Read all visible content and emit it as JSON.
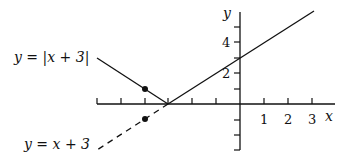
{
  "diagram": {
    "colors": {
      "ink": "#111111",
      "background": "#ffffff"
    },
    "axes": {
      "x_label": "x",
      "y_label": "y",
      "x_tick_labels": [
        "1",
        "2",
        "3"
      ],
      "y_tick_labels": [
        "2",
        "4"
      ],
      "x_ticks": [
        -6,
        -5,
        -4,
        -3,
        -2,
        -1,
        1,
        2,
        3
      ],
      "y_ticks": [
        -3,
        -2,
        -1,
        1,
        2,
        3,
        4,
        5
      ]
    },
    "curves": [
      {
        "name": "abs",
        "label": "y = |x + 3|",
        "style": "solid"
      },
      {
        "name": "linear",
        "label": "y = x + 3",
        "style": "dashed"
      }
    ],
    "points": [
      {
        "x": -4,
        "y": 1,
        "note": "on y = |x + 3|"
      },
      {
        "x": -4,
        "y": -1,
        "note": "on y = x + 3"
      }
    ],
    "labels": {
      "abs_eq": "y = |x + 3|",
      "lin_eq": "y = x + 3",
      "x_axis": "x",
      "y_axis": "y",
      "xt1": "1",
      "xt2": "2",
      "xt3": "3",
      "yt2": "2",
      "yt4": "4"
    }
  }
}
